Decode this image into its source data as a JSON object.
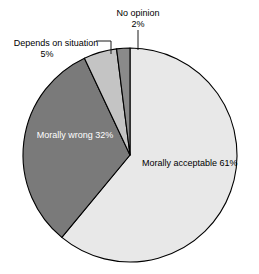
{
  "chart_data": {
    "type": "pie",
    "title": "",
    "subtitle": "",
    "xlabel": "",
    "ylabel": "",
    "legend": "none",
    "grid": false,
    "start_angle_deg": 0,
    "direction": "clockwise",
    "center": {
      "x": 130,
      "y": 155
    },
    "radius": 107,
    "total": 100,
    "unit": "%",
    "categories": [
      "Morally acceptable",
      "Morally wrong",
      "Depends on situation",
      "No opinion"
    ],
    "values": [
      61,
      32,
      5,
      2
    ],
    "slices": [
      {
        "label": "Morally acceptable",
        "value": 61,
        "value_text": "61%",
        "color": "#e8e8e8",
        "label_placement": "inside",
        "text_color": "#000000"
      },
      {
        "label": "Morally wrong",
        "value": 32,
        "value_text": "32%",
        "color": "#7a7a7a",
        "label_placement": "inside",
        "text_color": "#ffffff"
      },
      {
        "label": "Depends on situation",
        "value": 5,
        "value_text": "5%",
        "color": "#c4c4c4",
        "label_placement": "outside",
        "text_color": "#000000"
      },
      {
        "label": "No opinion",
        "value": 2,
        "value_text": "2%",
        "color": "#8a8a8a",
        "label_placement": "outside",
        "text_color": "#000000"
      }
    ],
    "stroke_color": "#000000",
    "background": "#ffffff"
  },
  "labels": {
    "no_opinion": {
      "name": "No opinion",
      "percent": "2%"
    },
    "depends": {
      "name": "Depends on situation",
      "percent": "5%"
    },
    "morally_wrong": {
      "name": "Morally wrong",
      "percent": "32%"
    },
    "morally_acceptable": {
      "name": "Morally acceptable",
      "percent": "61%"
    }
  }
}
